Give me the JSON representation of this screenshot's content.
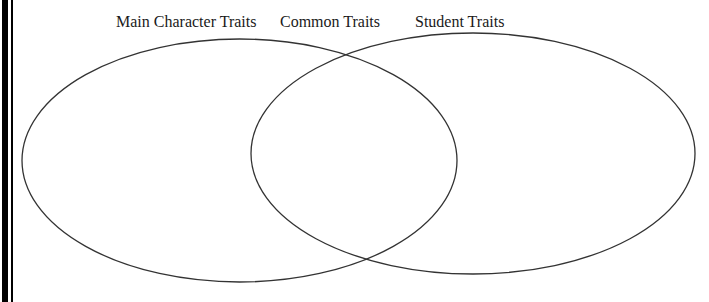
{
  "diagram": {
    "type": "venn",
    "labels": {
      "left": "Main Character Traits",
      "middle": "Common Traits",
      "right": "Student Traits"
    },
    "circles": [
      {
        "name": "Main Character Traits",
        "cx": 239.5,
        "cy": 160.5,
        "rx": 217.5,
        "ry": 121.5
      },
      {
        "name": "Student Traits",
        "cx": 473,
        "cy": 153.5,
        "rx": 222,
        "ry": 120.5
      }
    ],
    "stroke_color": "#333333",
    "border_color": "#000000"
  }
}
